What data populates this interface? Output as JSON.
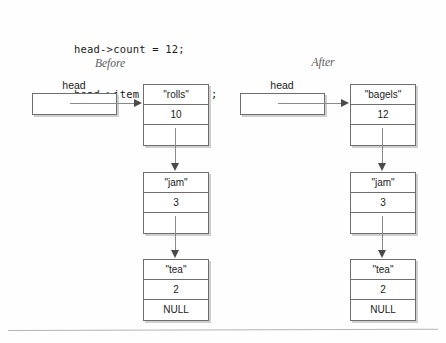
{
  "code": {
    "line1": "head->count = 12;",
    "line2": "head->item = \"bagels\";"
  },
  "columns": {
    "before": {
      "caption": "Before",
      "head_label": "head",
      "nodes": [
        {
          "item": "\"rolls\"",
          "count": "10",
          "next": ""
        },
        {
          "item": "\"jam\"",
          "count": "3",
          "next": ""
        },
        {
          "item": "\"tea\"",
          "count": "2",
          "next": "NULL"
        }
      ]
    },
    "after": {
      "caption": "After",
      "head_label": "head",
      "nodes": [
        {
          "item": "\"bagels\"",
          "count": "12",
          "next": ""
        },
        {
          "item": "\"jam\"",
          "count": "3",
          "next": ""
        },
        {
          "item": "\"tea\"",
          "count": "2",
          "next": "NULL"
        }
      ]
    }
  },
  "colors": {
    "ink": "#1b1b1b",
    "line": "#8a8a8a",
    "border": "#6e6e6e",
    "shadow": "#cfcfcf",
    "caption": "#5d5d5d",
    "rule": "#b4b4b4"
  }
}
